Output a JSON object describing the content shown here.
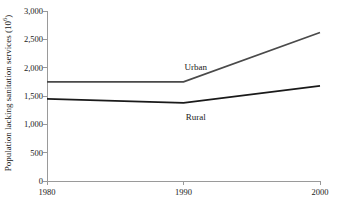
{
  "chart_data": {
    "type": "line",
    "title": "",
    "subtitle": "",
    "xlabel": "",
    "ylabel": "Population lacking sanitation services (10",
    "ylabel_exponent": "6",
    "ylabel_suffix": ")",
    "x": [
      1980,
      1990,
      2000
    ],
    "xlim": [
      1980,
      2000
    ],
    "ylim": [
      0,
      3000
    ],
    "xticks": [
      "1980",
      "1990",
      "2000"
    ],
    "xtick_values": [
      1980,
      1990,
      2000
    ],
    "yticks": [
      "0",
      "500",
      "1,000",
      "1,500",
      "2,000",
      "2,500",
      "3,000"
    ],
    "ytick_values": [
      0,
      500,
      1000,
      1500,
      2000,
      2500,
      3000
    ],
    "grid": false,
    "legend_position": "inline-annotation",
    "series": [
      {
        "name": "Urban",
        "values": [
          1750,
          1750,
          2620
        ],
        "color": "#4a4a4a",
        "label_x": 1990.9,
        "label_y": 2020
      },
      {
        "name": "Rural",
        "values": [
          1450,
          1380,
          1680
        ],
        "color": "#1a1a1a",
        "label_x": 1990.9,
        "label_y": 1130
      }
    ],
    "annotations": [
      {
        "text": "Urban",
        "x": 1990.9,
        "y": 2020
      },
      {
        "text": "Rural",
        "x": 1990.9,
        "y": 1130
      }
    ],
    "axis_color": "#9a9a9a",
    "background_color": "#ffffff"
  }
}
